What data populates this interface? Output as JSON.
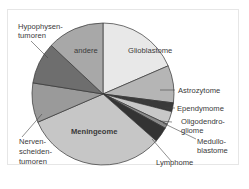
{
  "chart_data": {
    "type": "pie",
    "title": "",
    "start_angle_deg": 0,
    "direction": "clockwise",
    "slices": [
      {
        "label": "Glioblastome",
        "value": 18.5,
        "color": "#e8e8e8"
      },
      {
        "label": "Astrozytome",
        "value": 8.5,
        "color": "#b5b5b5"
      },
      {
        "label": "Ependymome",
        "value": 2.0,
        "color": "#3a3a3a"
      },
      {
        "label": "Oligodendrogliome",
        "value": 3.0,
        "color": "#c8c8c8"
      },
      {
        "label": "Medulloblastome",
        "value": 1.0,
        "color": "#8a8a8a"
      },
      {
        "label": "Lymphome",
        "value": 3.5,
        "color": "#333333"
      },
      {
        "label": "Meningeome",
        "value": 32.0,
        "color": "#c6c6c6"
      },
      {
        "label": "Nervenscheidentumoren",
        "value": 9.0,
        "color": "#9a9a9a"
      },
      {
        "label": "Hypophysentumoren",
        "value": 9.5,
        "color": "#6e6e6e"
      },
      {
        "label": "andere",
        "value": 13.0,
        "color": "#a8a8a8"
      }
    ]
  },
  "labels": {
    "glioblastome": "Glioblastome",
    "andere": "andere",
    "meningeome": "Meningeome",
    "astrozytome": "Astrozytome",
    "ependymome": "Ependymome",
    "oligo_1": "Oligodendro-",
    "oligo_2": "gliome",
    "medullo_1": "Medullo-",
    "medullo_2": "blastome",
    "lymphome": "Lymphome",
    "hypo_1": "Hypophysen-",
    "hypo_2": "tumoren",
    "nerven_1": "Nerven-",
    "nerven_2": "scheiden-",
    "nerven_3": "tumoren"
  }
}
